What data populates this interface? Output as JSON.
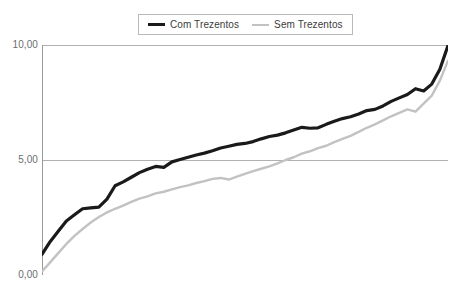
{
  "chart_data": {
    "type": "line",
    "title": "",
    "subtitle": "",
    "xlabel": "",
    "ylabel": "",
    "xlim": [
      0,
      100
    ],
    "ylim": [
      0,
      10
    ],
    "grid": true,
    "gridlines_y": [
      0,
      5,
      10
    ],
    "x_tick_labels": [],
    "y_tick_labels": [
      "10,00",
      "5,00",
      "0,00"
    ],
    "y_tick_values": [
      10,
      5,
      0
    ],
    "legend_position": "top-center",
    "decimal_separator": ",",
    "colors": {
      "series_com_trezentos": "#1a1a1a",
      "series_sem_trezentos": "#c2c2c2",
      "gridline": "#b0b0b0",
      "axis": "#9a9a9a",
      "tick_label": "#6d6e71",
      "legend_border": "#b9b9b9",
      "background": "#ffffff"
    },
    "x": [
      0,
      2,
      4,
      6,
      8,
      10,
      12,
      14,
      16,
      18,
      20,
      22,
      24,
      26,
      28,
      30,
      32,
      34,
      36,
      38,
      40,
      42,
      44,
      46,
      48,
      50,
      52,
      54,
      56,
      58,
      60,
      62,
      64,
      66,
      68,
      70,
      72,
      74,
      76,
      78,
      80,
      82,
      84,
      86,
      88,
      90,
      92,
      94,
      96,
      98,
      100
    ],
    "series": [
      {
        "name": "Com Trezentos",
        "color": "#1a1a1a",
        "width": 3.2,
        "values": [
          0.9,
          1.45,
          1.9,
          2.35,
          2.62,
          2.88,
          2.92,
          2.95,
          3.3,
          3.88,
          4.05,
          4.25,
          4.45,
          4.6,
          4.72,
          4.68,
          4.92,
          5.02,
          5.12,
          5.22,
          5.3,
          5.4,
          5.52,
          5.6,
          5.68,
          5.72,
          5.8,
          5.92,
          6.02,
          6.08,
          6.18,
          6.3,
          6.42,
          6.38,
          6.4,
          6.55,
          6.68,
          6.8,
          6.88,
          7.0,
          7.15,
          7.2,
          7.35,
          7.55,
          7.7,
          7.85,
          8.1,
          8.0,
          8.3,
          8.95,
          9.98
        ]
      },
      {
        "name": "Sem Trezentos",
        "color": "#c2c2c2",
        "width": 2.4,
        "values": [
          0.15,
          0.55,
          0.95,
          1.35,
          1.7,
          2.0,
          2.28,
          2.52,
          2.72,
          2.88,
          3.02,
          3.18,
          3.32,
          3.42,
          3.55,
          3.62,
          3.72,
          3.82,
          3.9,
          4.0,
          4.08,
          4.18,
          4.22,
          4.15,
          4.28,
          4.4,
          4.52,
          4.62,
          4.72,
          4.85,
          5.0,
          5.12,
          5.28,
          5.38,
          5.52,
          5.62,
          5.78,
          5.92,
          6.05,
          6.22,
          6.4,
          6.55,
          6.72,
          6.9,
          7.05,
          7.2,
          7.1,
          7.45,
          7.8,
          8.45,
          9.32
        ]
      }
    ]
  },
  "legend": {
    "entries": [
      {
        "label": "Com Trezentos",
        "marker": "line-swatch-dark"
      },
      {
        "label": "Sem Trezentos",
        "marker": "line-swatch-light"
      }
    ]
  },
  "axis": {
    "y_labels": [
      "10,00",
      "5,00",
      "0,00"
    ]
  }
}
